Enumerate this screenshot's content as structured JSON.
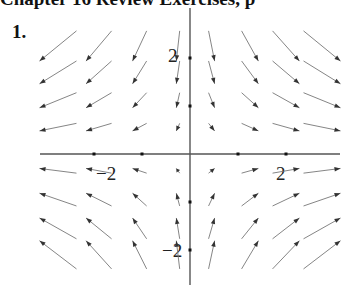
{
  "header": {
    "text": "Chapter 16 Review Exercises, p"
  },
  "problem": {
    "number": "1."
  },
  "chart_data": {
    "type": "vector_field",
    "title": "",
    "field": "F(x, y) = (x, -y)",
    "xlabel": "",
    "ylabel": "",
    "xlim": [
      -3,
      3.2
    ],
    "ylim": [
      -2.7,
      2.9
    ],
    "grid": false,
    "axes": {
      "origin_px": [
        190,
        154
      ],
      "px_per_unit": 48
    },
    "x_ticks": [
      -2,
      -1,
      1,
      2
    ],
    "y_ticks": [
      -2,
      -1,
      1,
      2
    ],
    "tick_labels": [
      {
        "text": "−2",
        "axis": "x",
        "value": -2
      },
      {
        "text": "2",
        "axis": "x",
        "value": 2
      },
      {
        "text": "2",
        "axis": "y",
        "value": 2
      },
      {
        "text": "−2",
        "axis": "y",
        "value": -2
      }
    ],
    "grid_x": [
      -2.75,
      -1.9,
      -1.05,
      -0.25,
      0.45,
      1.25,
      2.0,
      2.75
    ],
    "grid_y": [
      2.25,
      1.7,
      1.12,
      0.56,
      -0.35,
      -0.95,
      -1.55,
      -2.1
    ],
    "arrow_scale": 0.28,
    "arrow_color": "#333333"
  }
}
